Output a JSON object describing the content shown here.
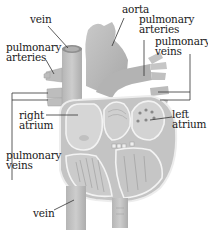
{
  "diagram": {
    "colors": {
      "tissue": "#bdbdbd",
      "tissue_dark": "#9a9a9a",
      "tissue_light": "#d9d9d9",
      "chamber": "#cfcfcf",
      "wall_outline": "#f2f2f2",
      "leader_line": "#333333",
      "text": "#1a1a1a"
    },
    "labels": [
      {
        "id": "vein-top",
        "text": "vein"
      },
      {
        "id": "aorta",
        "text": "aorta"
      },
      {
        "id": "pulmonary-arteries-right",
        "line1": "pulmonary",
        "line2": "arteries"
      },
      {
        "id": "pulmonary-veins-right",
        "line1": "pulmonary",
        "line2": "veins"
      },
      {
        "id": "pulmonary-arteries-left",
        "line1": "pulmonary",
        "line2": "arteries"
      },
      {
        "id": "right-atrium",
        "line1": "right",
        "line2": "atrium"
      },
      {
        "id": "left-atrium",
        "line1": "left",
        "line2": "atrium"
      },
      {
        "id": "pulmonary-veins-left",
        "line1": "pulmonary",
        "line2": "veins"
      },
      {
        "id": "vein-bottom",
        "text": "vein"
      }
    ]
  }
}
